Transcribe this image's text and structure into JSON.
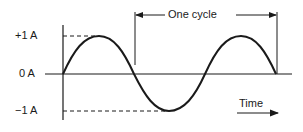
{
  "diagram": {
    "type": "sine-wave",
    "y_labels": {
      "pos": "+1 A",
      "zero": "0 A",
      "neg": "−1 A"
    },
    "cycle_label": "One cycle",
    "time_label": "Time",
    "colors": {
      "stroke": "#1a1a1a",
      "background": "#ffffff"
    }
  }
}
